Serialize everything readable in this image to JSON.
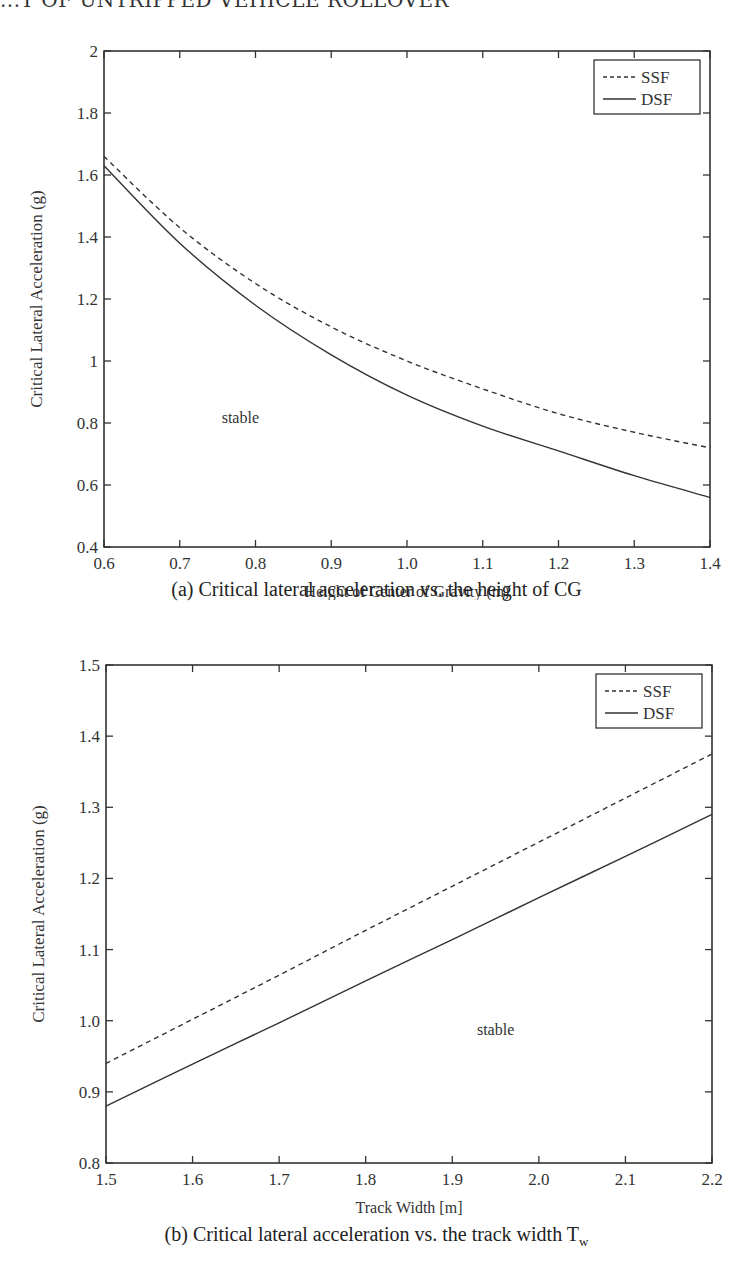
{
  "header": {
    "running_title": "...T OF UNTRIPPED VEHICLE ROLLOVER"
  },
  "chart_data": [
    {
      "type": "line",
      "id": "a",
      "title": "(a) Critical lateral acceleration vs. the height of CG",
      "xlabel": "Height of Center of Gravity (m)",
      "ylabel": "Critical Lateral Acceleration (g)",
      "xlim": [
        0.6,
        1.4
      ],
      "ylim": [
        0.4,
        2.0
      ],
      "xticks": [
        "0.6",
        "0.7",
        "0.8",
        "0.9",
        "1.0",
        "1.1",
        "1.2",
        "1.3",
        "1.4"
      ],
      "yticks": [
        "0.4",
        "0.6",
        "0.8",
        "1",
        "1.2",
        "1.4",
        "1.6",
        "1.8",
        "2"
      ],
      "grid": false,
      "legend_position": "upper right",
      "annotation": {
        "text": "stable",
        "x": 0.78,
        "y": 0.8
      },
      "x": [
        0.6,
        0.7,
        0.8,
        0.9,
        1.0,
        1.1,
        1.2,
        1.3,
        1.4
      ],
      "series": [
        {
          "name": "SSF",
          "style": "dashed",
          "values": [
            1.66,
            1.43,
            1.25,
            1.11,
            1.0,
            0.91,
            0.83,
            0.77,
            0.72
          ]
        },
        {
          "name": "DSF",
          "style": "solid",
          "values": [
            1.63,
            1.38,
            1.18,
            1.02,
            0.89,
            0.79,
            0.71,
            0.63,
            0.56
          ]
        }
      ]
    },
    {
      "type": "line",
      "id": "b",
      "title": "(b) Critical lateral acceleration vs. the track width T",
      "title_subscript": "w",
      "xlabel": "Track Width [m]",
      "ylabel": "Critical Lateral Acceleration (g)",
      "xlim": [
        1.5,
        2.2
      ],
      "ylim": [
        0.8,
        1.5
      ],
      "xticks": [
        "1.5",
        "1.6",
        "1.7",
        "1.8",
        "1.9",
        "2.0",
        "2.1",
        "2.2"
      ],
      "yticks": [
        "0.8",
        "0.9",
        "1.0",
        "1.1",
        "1.2",
        "1.3",
        "1.4",
        "1.5"
      ],
      "grid": false,
      "legend_position": "upper right",
      "annotation": {
        "text": "stable",
        "x": 1.95,
        "y": 0.98
      },
      "x": [
        1.5,
        1.6,
        1.7,
        1.8,
        1.9,
        2.0,
        2.1,
        2.2
      ],
      "series": [
        {
          "name": "SSF",
          "style": "dashed",
          "values": [
            0.94,
            1.002,
            1.064,
            1.127,
            1.189,
            1.251,
            1.313,
            1.375
          ]
        },
        {
          "name": "DSF",
          "style": "solid",
          "values": [
            0.88,
            0.939,
            0.997,
            1.056,
            1.114,
            1.173,
            1.231,
            1.29
          ]
        }
      ]
    }
  ]
}
